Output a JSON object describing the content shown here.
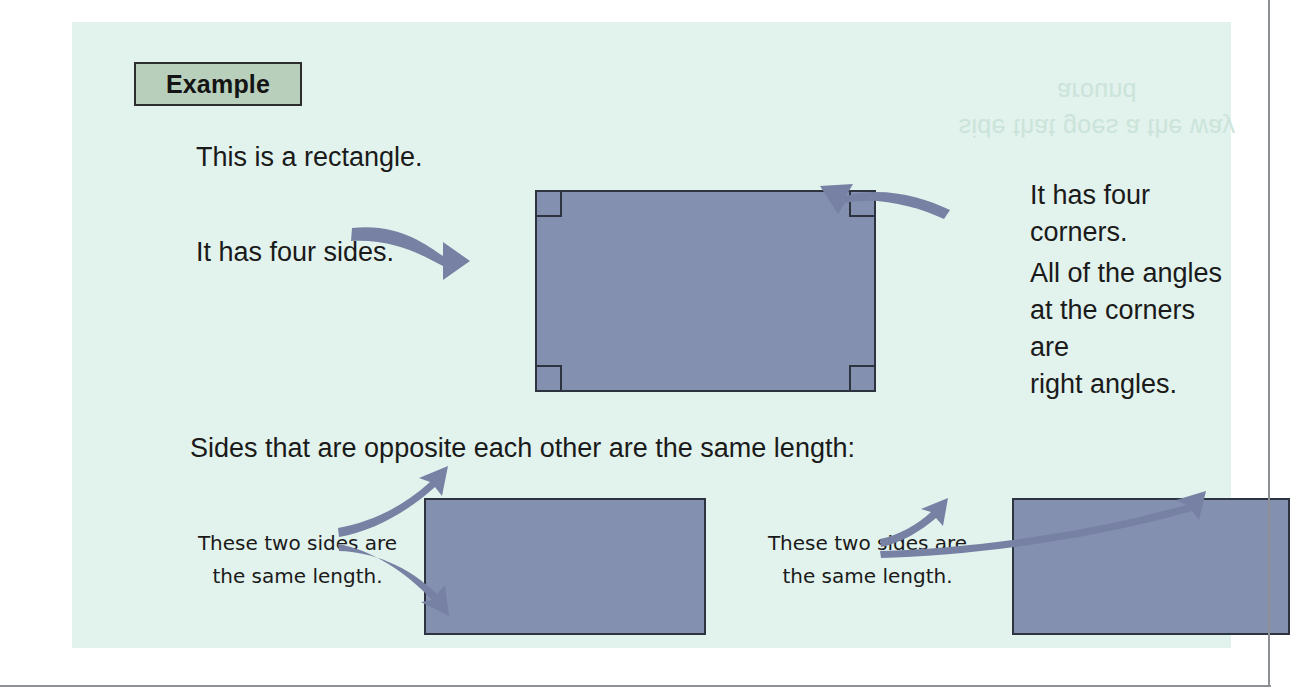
{
  "page": {
    "badge_label": "Example",
    "ghost_text": "side that goes a\nthe way around"
  },
  "intro": {
    "line1": "This is a rectangle.",
    "line2": "It has four sides."
  },
  "right_notes": {
    "corners": "It has four corners.",
    "angles": "All of the angles\nat the corners are\nright angles."
  },
  "opposite_section": {
    "heading": "Sides that are opposite each other are the same length:",
    "caption_left": "These two sides are\nthe same length.",
    "caption_right": "These two sides are\nthe same length."
  },
  "colors": {
    "panel_background": "#e2f2ec",
    "shape_fill": "#8490b0",
    "shape_stroke": "#2e3340",
    "badge_fill": "#b8cfbc",
    "arrow_fill": "#7781a4",
    "text": "#1a1a1a",
    "rule": "#8d9196"
  }
}
